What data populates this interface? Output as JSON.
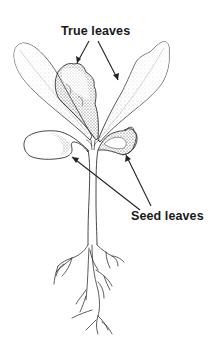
{
  "diagram": {
    "labels": {
      "true_leaves": "True leaves",
      "seed_leaves": "Seed leaves"
    },
    "parts": [
      "true-leaf-left-large",
      "true-leaf-center",
      "true-leaf-right",
      "seed-leaf-left",
      "seed-leaf-right",
      "stem",
      "roots"
    ],
    "colors": {
      "line": "#333333",
      "stipple": "#555555",
      "background": "#ffffff",
      "text": "#1a1a1a"
    }
  }
}
